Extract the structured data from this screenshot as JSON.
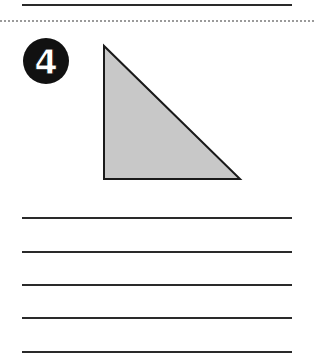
{
  "problem": {
    "number": "4",
    "shape": "right-triangle",
    "fill_color": "#c8c8c8",
    "stroke_color": "#1a1a1a"
  },
  "answer_lines": {
    "count": 5
  },
  "top_line": true,
  "separator": "dotted"
}
